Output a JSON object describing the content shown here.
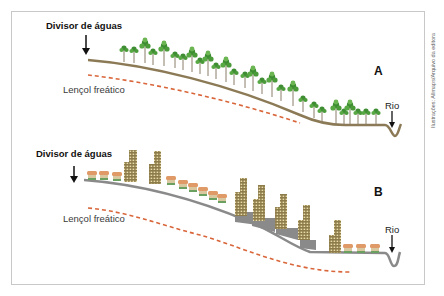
{
  "panel_a": {
    "label": "A",
    "divider_label": "Divisor de águas",
    "water_table_label": "Lençol freático",
    "river_label": "Rio",
    "ground_color": "#8b7a55",
    "vegetation": "forest"
  },
  "panel_b": {
    "label": "B",
    "divider_label": "Divisor de águas",
    "water_table_label": "Lençol freático",
    "river_label": "Rio",
    "ground_color": "#8a8a8a",
    "vegetation": "urban"
  },
  "credit": "Ilustrações: Allmaps/Arquivo da editora",
  "colors": {
    "water_table_dash": "#d9663a",
    "tree_green": "#4a9a3a",
    "building": "#9c8a55",
    "house_roof": "#e0a070"
  }
}
